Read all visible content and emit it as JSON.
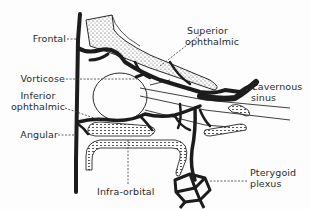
{
  "figure": {
    "colors": {
      "vein": "#1c1c1c",
      "bone_outline": "#2a2a2a",
      "bone_fill": "#f4f4f4",
      "leader": "#3a3a3a",
      "background": "#fdfdfd"
    }
  },
  "labels": {
    "frontal": "Frontal",
    "superior_ophthalmic_line1": "Superior",
    "superior_ophthalmic_line2": "ophthalmic",
    "vorticose": "Vorticose",
    "inferior_ophthalmic_line1": "Inferior",
    "inferior_ophthalmic_line2": "ophthalmic",
    "cavernous_sinus_line1": "Cavernous",
    "cavernous_sinus_line2": "sinus",
    "angular": "Angular",
    "infra_orbital": "Infra-orbital",
    "pterygoid_plexus_line1": "Pterygoid",
    "pterygoid_plexus_line2": "plexus"
  }
}
